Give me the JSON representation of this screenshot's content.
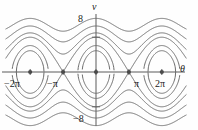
{
  "figure": {
    "kind": "phase-portrait"
  },
  "axes": {
    "x_label": "θ",
    "y_label": "v",
    "x_ticks": [
      {
        "label": "−2π",
        "value": -6.2832
      },
      {
        "label": "−π",
        "value": -3.1416
      },
      {
        "label": "π",
        "value": 3.1416
      },
      {
        "label": "2π",
        "value": 6.2832
      }
    ],
    "y_ticks": [
      {
        "label": "8",
        "value": 8
      },
      {
        "label": "−8",
        "value": -8
      }
    ]
  },
  "chart_data": {
    "type": "line",
    "title": "",
    "xlabel": "θ",
    "ylabel": "v",
    "xlim": [
      -8.6,
      8.6
    ],
    "ylim": [
      -11.5,
      11.5
    ],
    "grid": false,
    "legend": "none",
    "equilibria": {
      "centers": [
        {
          "theta": -6.2832,
          "v": 0
        },
        {
          "theta": 0,
          "v": 0
        },
        {
          "theta": 6.2832,
          "v": 0
        }
      ],
      "saddles": [
        {
          "theta": -3.1416,
          "v": 0
        },
        {
          "theta": 3.1416,
          "v": 0
        }
      ]
    },
    "series": [
      {
        "name": "separatrix",
        "energy": 16,
        "v_at_zero": 8
      },
      {
        "name": "closed-orbit-outer",
        "energy": 11.8,
        "v_at_zero": 6.1
      },
      {
        "name": "closed-orbit-inner",
        "energy": 6.4,
        "v_at_zero": 4.2
      },
      {
        "name": "rotation-upper-1",
        "energy": 19.5,
        "v_min": 4.2
      },
      {
        "name": "rotation-upper-2",
        "energy": 25.0,
        "v_min": 6.7
      },
      {
        "name": "rotation-upper-3",
        "energy": 32.0,
        "v_min": 8.9
      },
      {
        "name": "rotation-lower-1",
        "energy": 19.5,
        "v_max": -4.2
      },
      {
        "name": "rotation-lower-2",
        "energy": 25.0,
        "v_max": -6.7
      },
      {
        "name": "rotation-lower-3",
        "energy": 32.0,
        "v_max": -8.9
      }
    ]
  },
  "style": {
    "curve_color": "#6b6b6b",
    "axis_color": "#5a5a5a",
    "point_color": "#4a4a4a",
    "background": "#fefefe"
  }
}
